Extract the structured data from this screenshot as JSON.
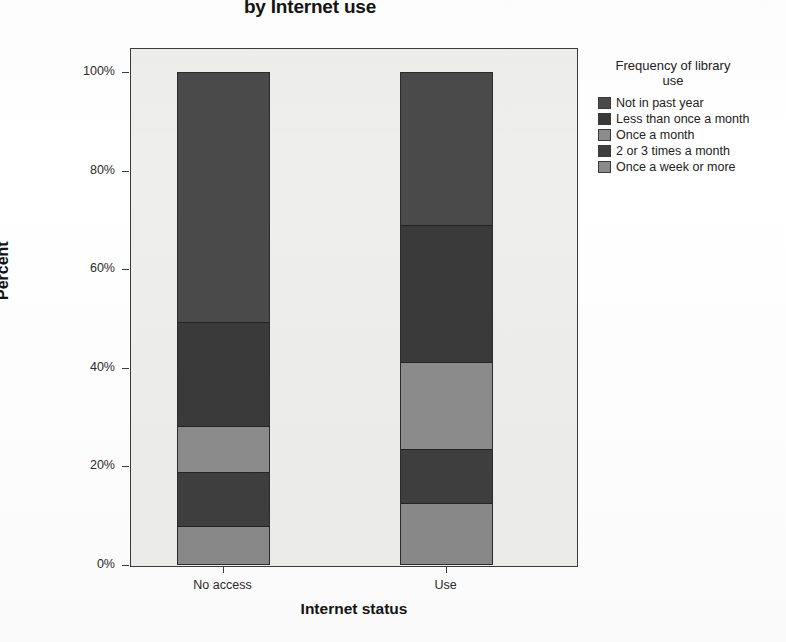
{
  "chart_data": {
    "type": "bar",
    "stacked": true,
    "normalized": true,
    "title": "by Internet use",
    "title_line_clipped": "Frequency of library use by Internet use",
    "xlabel": "Internet status",
    "ylabel": "Percent",
    "categories": [
      "No access",
      "Use"
    ],
    "ylim": [
      0,
      100
    ],
    "yticks": [
      "0%",
      "20%",
      "40%",
      "60%",
      "80%",
      "100%"
    ],
    "ytick_values": [
      0,
      20,
      40,
      60,
      80,
      100
    ],
    "grid": false,
    "legend_title": "Frequency of library use",
    "legend_position": "right",
    "series": [
      {
        "name": "Not in past year",
        "color": "#4a4a4a",
        "values": [
          51.0,
          31.2
        ]
      },
      {
        "name": "Less than once a month",
        "color": "#3a3a3a",
        "values": [
          21.0,
          27.8
        ]
      },
      {
        "name": "Once a month",
        "color": "#8c8c8c",
        "values": [
          9.5,
          17.7
        ]
      },
      {
        "name": "2 or 3 times a month",
        "color": "#3f3f3f",
        "values": [
          11.0,
          11.1
        ]
      },
      {
        "name": "Once a week or more",
        "color": "#8a8a8a",
        "values": [
          7.5,
          12.2
        ]
      }
    ],
    "cumulative_boundaries": {
      "No access": [
        100,
        49,
        28,
        18.5,
        7.5,
        0
      ],
      "Use": [
        100,
        68.8,
        41.0,
        23.3,
        12.2,
        0
      ]
    }
  },
  "axes": {
    "y_ticks": [
      {
        "label": "100%",
        "value": 100
      },
      {
        "label": "80%",
        "value": 80
      },
      {
        "label": "60%",
        "value": 60
      },
      {
        "label": "40%",
        "value": 40
      },
      {
        "label": "20%",
        "value": 20
      },
      {
        "label": "0%",
        "value": 0
      }
    ],
    "x_ticks": [
      {
        "label": "No access"
      },
      {
        "label": "Use"
      }
    ],
    "ylabel": "Percent",
    "xlabel": "Internet status"
  },
  "legend": {
    "title_line1": "Frequency of library",
    "title_line2": "use",
    "items": [
      {
        "label": "Not in past year",
        "color": "#4a4a4a"
      },
      {
        "label": "Less than once a month",
        "color": "#3a3a3a"
      },
      {
        "label": "Once a month",
        "color": "#8c8c8c"
      },
      {
        "label": "2 or 3 times a month",
        "color": "#3f3f3f"
      },
      {
        "label": "Once a week or more",
        "color": "#8a8a8a"
      }
    ]
  },
  "colors": {
    "plot_background": "#eeeeec",
    "frame": "#3b3b3b",
    "page_background": "#ffffff",
    "text": "#1a1a1a"
  }
}
